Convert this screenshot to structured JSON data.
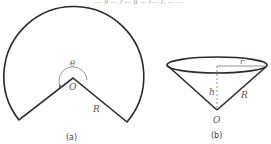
{
  "top_text_fragment": "... g ... ) ... g ... (... ), ... ...",
  "figure_a": {
    "caption": "(a)",
    "center_label": "O",
    "angle_label": "θ",
    "radius_label": "R",
    "description": "circular sector with central angle θ greater than 180°, radius R, center O"
  },
  "figure_b": {
    "caption": "(b)",
    "apex_label": "O",
    "height_label": "h",
    "base_radius_label": "r",
    "slant_label": "R",
    "description": "cone formed by rolling the sector; slant height R, base radius r, height h"
  },
  "colors": {
    "stroke": "#2a2a2a",
    "label": "#555555"
  }
}
